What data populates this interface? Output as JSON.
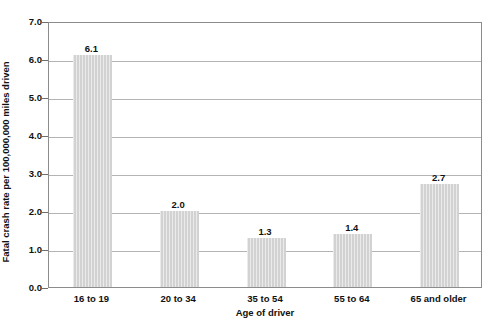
{
  "chart_data": {
    "type": "bar",
    "title": "",
    "subtitle": "",
    "xlabel": "Age of driver",
    "ylabel": "Fatal crash rate per 100,000,000 miles driven",
    "categories": [
      "16 to 19",
      "20 to 34",
      "35 to 54",
      "55 to 64",
      "65 and older"
    ],
    "values": [
      6.1,
      2.0,
      1.3,
      1.4,
      2.7
    ],
    "value_labels": [
      "6.1",
      "2.0",
      "1.3",
      "1.4",
      "2.7"
    ],
    "ylim": [
      0.0,
      7.0
    ],
    "ytick_step": 1.0,
    "ytick_labels": [
      "0.0",
      "1.0",
      "2.0",
      "3.0",
      "4.0",
      "5.0",
      "6.0",
      "7.0"
    ],
    "grid": "horizontal",
    "legend": "none",
    "orientation": "vertical",
    "bar_color": "#d2d2d2",
    "gridline_color": "#b4b4b4",
    "axis_color": "#8c8c8c",
    "text_color": "#111111",
    "annotations": []
  },
  "clipped_header": {
    "text": ""
  }
}
